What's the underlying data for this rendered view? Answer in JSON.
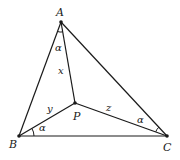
{
  "diagram": {
    "points": {
      "A": {
        "label": "A",
        "x": 61,
        "y": 22
      },
      "B": {
        "label": "B",
        "x": 19,
        "y": 136
      },
      "C": {
        "label": "C",
        "x": 167,
        "y": 136
      },
      "P": {
        "label": "P",
        "x": 75,
        "y": 103
      }
    },
    "segment_labels": {
      "AP": "x",
      "BP": "y",
      "CP": "z"
    },
    "angle_labels": {
      "at_A": "α",
      "at_B": "α",
      "at_C": "α"
    },
    "colors": {
      "stroke": "#1a1a1a",
      "background": "#ffffff"
    }
  }
}
